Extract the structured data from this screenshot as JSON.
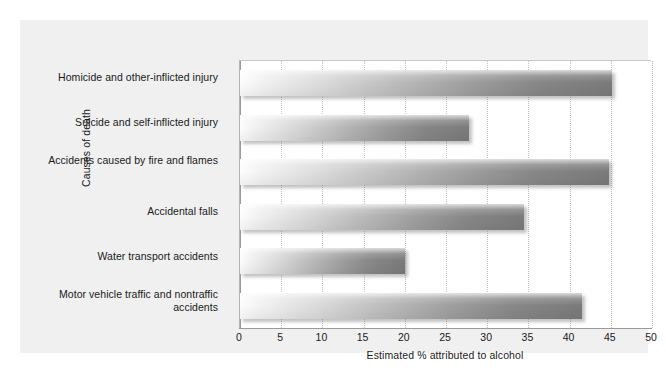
{
  "chart_data": {
    "type": "bar",
    "orientation": "horizontal",
    "title": "",
    "xlabel": "Estimated % attributed to alcohol",
    "ylabel": "Causes of death",
    "xlim": [
      0,
      50
    ],
    "xticks": [
      "0",
      "5",
      "10",
      "15",
      "20",
      "25",
      "30",
      "35",
      "40",
      "45",
      "50"
    ],
    "grid": "vertical-dotted",
    "legend": "none",
    "categories": [
      "Homicide and other-inflicted injury",
      "Suicide and self-inflicted injury",
      "Accidents caused by fire and flames",
      "Accidental falls",
      "Water transport accidents",
      "Motor vehicle traffic and nontraffic accidents"
    ],
    "values": [
      45.2,
      27.8,
      44.8,
      34.5,
      20.0,
      41.5
    ]
  },
  "colors": {
    "frame_background": "#f0f0f0",
    "plot_background": "#ffffff",
    "bar_gradient_start": "#fdfdfd",
    "bar_gradient_end": "#7a7a7a",
    "gridline": "#c0c0c0",
    "axis_line": "#9a9a9a",
    "text": "#1a1a1a"
  }
}
